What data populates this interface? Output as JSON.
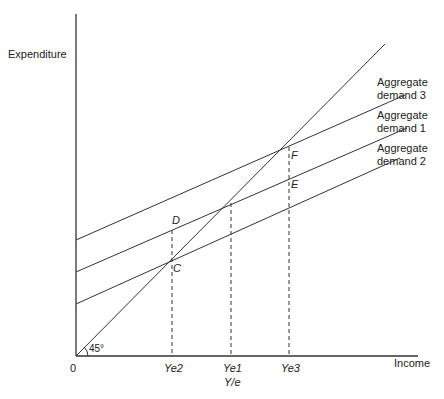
{
  "diagram": {
    "y_axis_label": "Expenditure",
    "x_axis_label": "Income",
    "origin_label": "0",
    "angle_label": "45°",
    "x_ticks": [
      "Ye2",
      "Ye1",
      "Ye3"
    ],
    "full_employment_label": "Y/e",
    "points": {
      "C": "C",
      "D": "D",
      "E": "E",
      "F": "F"
    },
    "curves": [
      {
        "name": "Aggregate demand 3",
        "line1": "Aggregate",
        "line2": "demand 3"
      },
      {
        "name": "Aggregate demand 1",
        "line1": "Aggregate",
        "line2": "demand 1"
      },
      {
        "name": "Aggregate demand 2",
        "line1": "Aggregate",
        "line2": "demand 2"
      }
    ],
    "colors": {
      "line": "#333333",
      "background": "#ffffff"
    }
  }
}
